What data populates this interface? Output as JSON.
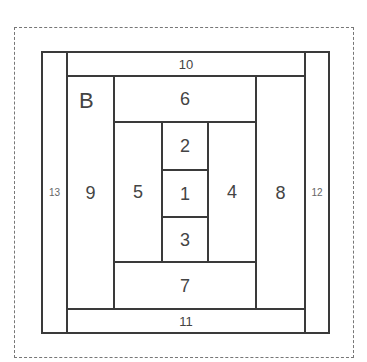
{
  "diagram": {
    "title_letter": "B",
    "type": "log-cabin quilt block piecing diagram",
    "border_style": "dashed",
    "pieces": [
      {
        "id": "p13",
        "label": "13",
        "x": 41,
        "y": 51,
        "w": 27,
        "h": 283,
        "size": "tiny"
      },
      {
        "id": "p12",
        "label": "12",
        "x": 304,
        "y": 51,
        "w": 26,
        "h": 283,
        "size": "tiny"
      },
      {
        "id": "p10",
        "label": "10",
        "x": 66,
        "y": 51,
        "w": 240,
        "h": 26,
        "size": "small"
      },
      {
        "id": "p11",
        "label": "11",
        "x": 66,
        "y": 308,
        "w": 240,
        "h": 26,
        "size": "small"
      },
      {
        "id": "p9",
        "label": "9",
        "x": 66,
        "y": 75,
        "w": 49,
        "h": 235,
        "size": "normal"
      },
      {
        "id": "p8",
        "label": "8",
        "x": 255,
        "y": 75,
        "w": 51,
        "h": 235,
        "size": "normal"
      },
      {
        "id": "p6",
        "label": "6",
        "x": 113,
        "y": 75,
        "w": 144,
        "h": 48,
        "size": "normal"
      },
      {
        "id": "p7",
        "label": "7",
        "x": 113,
        "y": 261,
        "w": 144,
        "h": 49,
        "size": "normal"
      },
      {
        "id": "p5",
        "label": "5",
        "x": 113,
        "y": 121,
        "w": 50,
        "h": 142,
        "size": "normal"
      },
      {
        "id": "p4",
        "label": "4",
        "x": 207,
        "y": 121,
        "w": 50,
        "h": 142,
        "size": "normal"
      },
      {
        "id": "p2",
        "label": "2",
        "x": 161,
        "y": 121,
        "w": 48,
        "h": 50,
        "size": "normal"
      },
      {
        "id": "p1",
        "label": "1",
        "x": 161,
        "y": 169,
        "w": 48,
        "h": 49,
        "size": "normal"
      },
      {
        "id": "p3",
        "label": "3",
        "x": 161,
        "y": 216,
        "w": 48,
        "h": 47,
        "size": "normal"
      }
    ]
  }
}
